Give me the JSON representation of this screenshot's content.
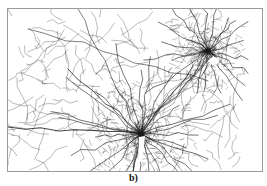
{
  "figure": {
    "caption": "b)",
    "type": "road-network-map",
    "colors": {
      "background": "#ffffff",
      "road": "#1a1a1a",
      "frame": "#9a9a9a"
    },
    "clusters": [
      {
        "name": "primary-city",
        "x": 133,
        "y": 125,
        "radius": 38,
        "density": 1.0
      },
      {
        "name": "secondary-city",
        "x": 200,
        "y": 42,
        "radius": 30,
        "density": 0.8
      }
    ],
    "coast": {
      "description": "open area on right side",
      "x_start": 225
    }
  }
}
